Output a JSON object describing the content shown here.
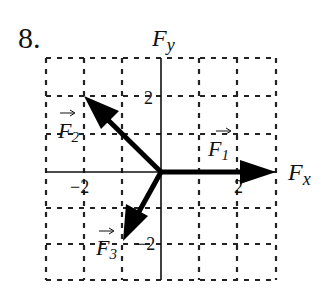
{
  "problem": {
    "number_label": "8."
  },
  "diagram": {
    "type": "vector-diagram",
    "x_axis_label": "F",
    "x_axis_subscript": "x",
    "y_axis_label": "F",
    "y_axis_subscript": "y",
    "grid": {
      "x_range": [
        -3,
        3
      ],
      "y_range": [
        -3,
        3
      ],
      "spacing_units": 1,
      "style": "dashed"
    },
    "tick_labels": {
      "x_neg": "−2",
      "x_pos": "2",
      "y_pos": "2",
      "y_neg": "−2"
    },
    "vectors": [
      {
        "name": "F",
        "subscript": "1",
        "tail": [
          0,
          0
        ],
        "tip": [
          3,
          0
        ]
      },
      {
        "name": "F",
        "subscript": "2",
        "tail": [
          0,
          0
        ],
        "tip": [
          -2,
          2
        ]
      },
      {
        "name": "F",
        "subscript": "3",
        "tail": [
          0,
          0
        ],
        "tip": [
          -1,
          -2
        ]
      }
    ],
    "colors": {
      "ink": "#000000",
      "background": "#ffffff"
    }
  }
}
